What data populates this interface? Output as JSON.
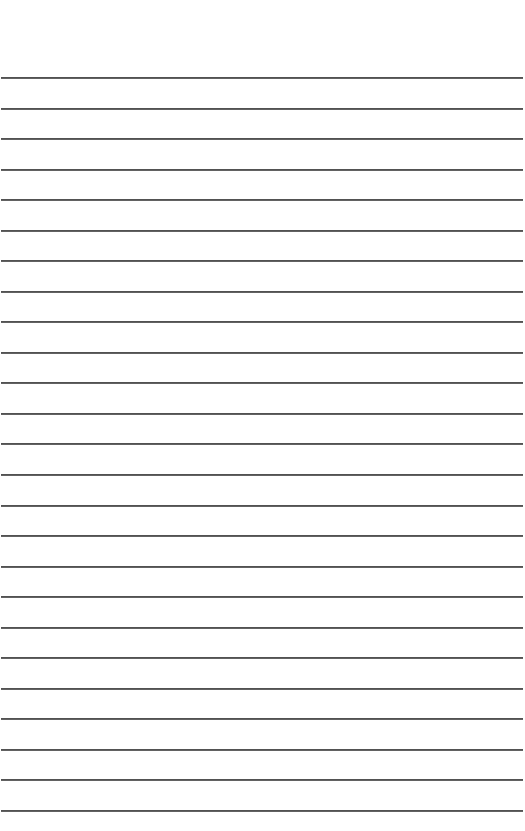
{
  "page": {
    "type": "lined-paper",
    "background_color": "#ffffff",
    "line_color": "#4a4a4a",
    "line_count": 25,
    "first_line_y": 78,
    "line_spacing": 30.54,
    "line_left": 1,
    "line_width": 522,
    "line_thickness": 2
  }
}
